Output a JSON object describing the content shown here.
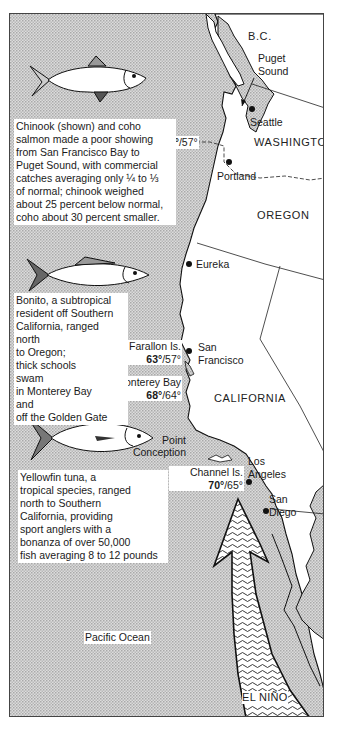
{
  "regions": {
    "bc": "B.C.",
    "washington": "WASHINGTON",
    "oregon": "OREGON",
    "california": "CALIFORNIA",
    "ocean": "Pacific Ocean"
  },
  "places": {
    "puget_1": "Puget",
    "puget_2": "Sound",
    "seattle": "Seattle",
    "portland": "Portland",
    "eureka": "Eureka",
    "sf_1": "San",
    "sf_2": "Francisco",
    "la_1": "Los",
    "la_2": "Angeles",
    "sd_1": "San",
    "sd_2": "Diego",
    "point_1": "Point",
    "point_2": "Conception"
  },
  "temperatures": {
    "washington": {
      "high": "63°",
      "low": "/57°"
    },
    "farallon": {
      "label": "Farallon Is.",
      "high": "63°",
      "low": "/57°"
    },
    "monterey": {
      "label": "Monterey Bay",
      "high": "68°",
      "low": "/64°"
    },
    "channel": {
      "label": "Channel Is.",
      "high": "70°",
      "low": "/65°"
    }
  },
  "current": {
    "label": "EL NIÑO"
  },
  "fish": [
    {
      "name": "chinook-salmon",
      "lines": [
        "Chinook (shown) and coho",
        "salmon made a poor showing",
        "from San Francisco Bay to",
        "Puget Sound, with commercial",
        "catches averaging only ¼ to ⅓",
        "of normal; chinook weighed",
        "about 25 percent below normal,",
        "coho about 30 percent smaller."
      ]
    },
    {
      "name": "bonito",
      "lines": [
        "Bonito, a subtropical",
        "resident off Southern",
        "California, ranged",
        "north",
        "to Oregon;",
        "thick schools",
        "swam",
        "in Monterey Bay",
        "and",
        "off the Golden Gate"
      ]
    },
    {
      "name": "yellowfin-tuna",
      "lines": [
        "Yellowfin tuna, a",
        "tropical species, ranged",
        "north to Southern",
        "California, providing",
        "sport anglers with a",
        "bonanza of over 50,000",
        "fish averaging 8 to 12 pounds"
      ]
    }
  ],
  "colors": {
    "ocean": "#cfcfcf",
    "land": "#ffffff",
    "line": "#111111"
  }
}
